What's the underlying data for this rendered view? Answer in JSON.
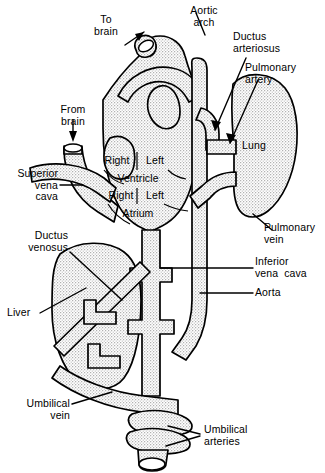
{
  "figure": {
    "type": "anatomical-diagram",
    "colors": {
      "outline": "#000000",
      "fill_stipple": "#e2e2e2",
      "background": "#ffffff",
      "text": "#000000"
    }
  },
  "labels": {
    "to_brain": "To\nbrain",
    "aortic_arch": "Aortic\narch",
    "ductus_arteriosus": "Ductus\narteriosus",
    "pulmonary_artery": "Pulmonary\nartery",
    "lung": "Lung",
    "from_brain": "From\nbrain",
    "superior_vena_cava": "Superior\nvena\ncava",
    "right_ventricle": "Right",
    "left_ventricle": "Left",
    "ventricle": "Ventricle",
    "right_atrium": "Right",
    "left_atrium": "Left",
    "atrium": "Atrium",
    "pulmonary_vein": "Pulmonary\nvein",
    "ductus_venosus": "Ductus\nvenosus",
    "inferior_vena_cava": "Inferior\nvena  cava",
    "aorta": "Aorta",
    "liver": "Liver",
    "umbilical_vein": "Umbilical\nvein",
    "umbilical_arteries": "Umbilical\narteries"
  },
  "structures": [
    "superior vena cava",
    "right atrium",
    "left atrium",
    "right ventricle",
    "left ventricle",
    "aortic arch",
    "ductus arteriosus",
    "pulmonary artery",
    "pulmonary vein",
    "lung",
    "descending aorta",
    "inferior vena cava",
    "ductus venosus",
    "liver",
    "umbilical vein",
    "umbilical arteries"
  ]
}
